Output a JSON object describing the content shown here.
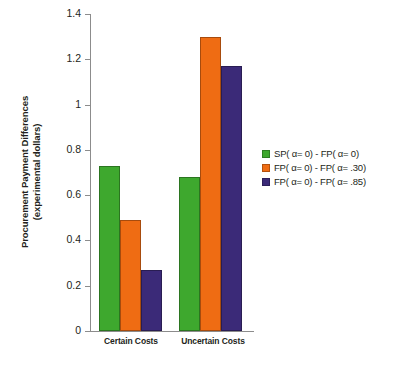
{
  "chart_data": {
    "type": "bar",
    "title": "",
    "xlabel": "",
    "ylabel": "Procurement Payment Differences (experimental dollars)",
    "ylabel_line1": "Procurement Payment Differences",
    "ylabel_line2": "(experimental dollars)",
    "categories": [
      "Certain Costs",
      "Uncertain Costs"
    ],
    "series": [
      {
        "name": "SP( α= 0) - FP( α= 0)",
        "color": "#3EA82E",
        "values": [
          0.73,
          0.68
        ]
      },
      {
        "name": "FP( α= 0) - FP( α= .30)",
        "color": "#EF6C13",
        "values": [
          0.49,
          1.3
        ]
      },
      {
        "name": "FP( α= 0) - FP( α= .85)",
        "color": "#3B2A78",
        "values": [
          0.27,
          1.17
        ]
      }
    ],
    "ylim": [
      0,
      1.4
    ],
    "ytick_labels": [
      "0",
      "0.2",
      "0.4",
      "0.6",
      "0.8",
      "1",
      "1.2",
      "1.4"
    ],
    "ytick_values": [
      0,
      0.2,
      0.4,
      0.6,
      0.8,
      1.0,
      1.2,
      1.4
    ],
    "grid": false,
    "legend_position": "right"
  }
}
